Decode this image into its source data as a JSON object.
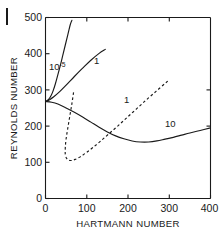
{
  "figure": {
    "margin_mark": "figure-bar-mark"
  },
  "chart_data": {
    "type": "line",
    "title": "",
    "subtitle": "",
    "xlabel": "HARTMANN NUMBER",
    "ylabel": "REYNOLDS NUMBER",
    "xlim": [
      0,
      400
    ],
    "ylim": [
      0,
      500
    ],
    "xticks": [
      0,
      100,
      200,
      300,
      400
    ],
    "yticks": [
      0,
      100,
      200,
      300,
      400,
      500
    ],
    "xtick_labels": [
      "0",
      "100",
      "200",
      "300",
      "400"
    ],
    "ytick_labels": [
      "0",
      "100",
      "200",
      "300",
      "400",
      "500"
    ],
    "grid": false,
    "legend": "inline-curve-labels",
    "legend_position": "inline",
    "common_origin": {
      "x": 0,
      "y": 268
    },
    "annotations": [
      {
        "text": "10",
        "superscript": "-5",
        "x": 33,
        "y": 355,
        "curve": "10^-5"
      },
      {
        "text": "1",
        "x": 117,
        "y": 378,
        "curve": "1-solid"
      },
      {
        "text": "1",
        "x": 205,
        "y": 272,
        "curve": "1-dashed"
      },
      {
        "text": "10",
        "x": 322,
        "y": 208,
        "curve": "10"
      }
    ],
    "series": [
      {
        "name": "10^-5",
        "style": "solid",
        "label": "10⁻⁵",
        "points": [
          [
            0,
            268
          ],
          [
            6,
            272
          ],
          [
            12,
            281
          ],
          [
            18,
            296
          ],
          [
            24,
            317
          ],
          [
            30,
            342
          ],
          [
            36,
            368
          ],
          [
            42,
            396
          ],
          [
            48,
            424
          ],
          [
            54,
            452
          ],
          [
            60,
            480
          ],
          [
            64,
            492
          ]
        ]
      },
      {
        "name": "1-solid",
        "style": "solid",
        "label": "1",
        "points": [
          [
            0,
            268
          ],
          [
            10,
            273
          ],
          [
            20,
            281
          ],
          [
            35,
            296
          ],
          [
            50,
            313
          ],
          [
            70,
            337
          ],
          [
            90,
            360
          ],
          [
            110,
            382
          ],
          [
            130,
            401
          ],
          [
            145,
            412
          ]
        ]
      },
      {
        "name": "10",
        "style": "solid",
        "label": "10",
        "points": [
          [
            0,
            268
          ],
          [
            15,
            266
          ],
          [
            30,
            261
          ],
          [
            50,
            250
          ],
          [
            70,
            238
          ],
          [
            90,
            225
          ],
          [
            110,
            211
          ],
          [
            130,
            197
          ],
          [
            150,
            184
          ],
          [
            170,
            173
          ],
          [
            190,
            165
          ],
          [
            210,
            159
          ],
          [
            230,
            156
          ],
          [
            250,
            156
          ],
          [
            270,
            159
          ],
          [
            290,
            164
          ],
          [
            310,
            169
          ],
          [
            330,
            175
          ],
          [
            350,
            181
          ],
          [
            375,
            188
          ],
          [
            400,
            195
          ]
        ]
      },
      {
        "name": "1-dashed",
        "style": "dashed",
        "label": "1",
        "points": [
          [
            68,
            293
          ],
          [
            64,
            262
          ],
          [
            59,
            228
          ],
          [
            54,
            194
          ],
          [
            50,
            165
          ],
          [
            48,
            141
          ],
          [
            48,
            122
          ],
          [
            51,
            111
          ],
          [
            56,
            106
          ],
          [
            63,
            105
          ],
          [
            72,
            108
          ],
          [
            84,
            115
          ],
          [
            98,
            126
          ],
          [
            114,
            140
          ],
          [
            132,
            157
          ],
          [
            152,
            177
          ],
          [
            174,
            199
          ],
          [
            196,
            222
          ],
          [
            220,
            247
          ],
          [
            244,
            272
          ],
          [
            268,
            296
          ],
          [
            290,
            318
          ],
          [
            300,
            328
          ]
        ]
      }
    ]
  }
}
